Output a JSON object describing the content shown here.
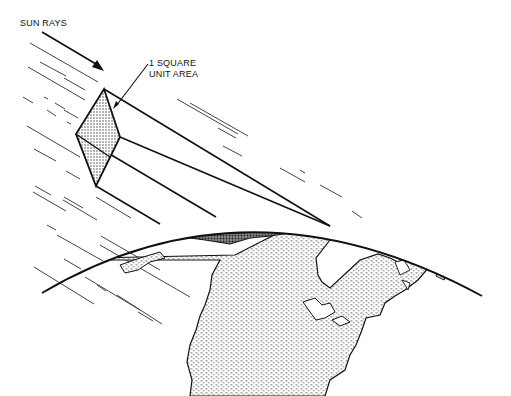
{
  "diagram": {
    "labels": {
      "sun_rays": "SUN RAYS",
      "area_line1": "1 SQUARE",
      "area_line2": "UNIT AREA"
    },
    "colors": {
      "ink": "#111111",
      "background": "#ffffff",
      "stipple": "#555555"
    }
  }
}
